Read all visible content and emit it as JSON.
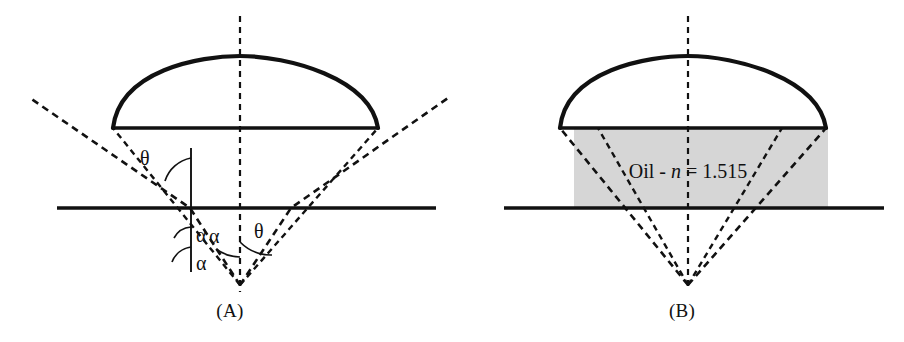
{
  "figure": {
    "type": "optical-ray-diagram",
    "panels": [
      {
        "id": "A",
        "caption": "(A)",
        "medium": "air",
        "angle_labels": [
          {
            "id": "theta-upper",
            "symbol": "θ"
          },
          {
            "id": "alpha-upper",
            "symbol": "α"
          },
          {
            "id": "alpha-lower",
            "symbol": "α"
          },
          {
            "id": "alpha-apex",
            "symbol": "α"
          },
          {
            "id": "theta-apex",
            "symbol": "θ"
          }
        ]
      },
      {
        "id": "B",
        "caption": "(B)",
        "medium": "oil",
        "medium_label": {
          "prefix": "Oil - ",
          "symbol": "n",
          "equals": " = ",
          "value": "1.515",
          "full": "Oil - n = 1.515"
        },
        "angle_labels": []
      }
    ]
  },
  "colors": {
    "ink": "#111111",
    "background": "#ffffff",
    "oil_fill": "#d6d6d6"
  }
}
